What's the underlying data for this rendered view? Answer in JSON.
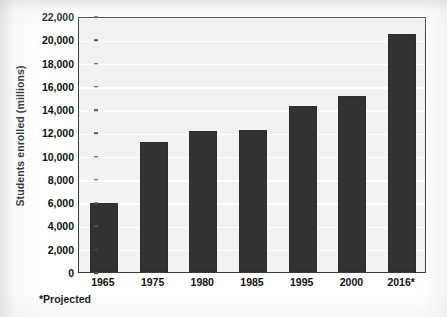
{
  "chart_data": {
    "type": "bar",
    "title": "",
    "xlabel": "",
    "ylabel": "Students enrolled (millions)",
    "categories": [
      "1965",
      "1975",
      "1980",
      "1985",
      "1995",
      "2000",
      "2016*"
    ],
    "values": [
      5921,
      11185,
      12097,
      12247,
      14261,
      15135,
      20442
    ],
    "value_labels": [
      "5,921",
      "11,185",
      "12,097",
      "12,247",
      "14,261",
      "15,135",
      "20,442"
    ],
    "ylim": [
      0,
      22000
    ],
    "ytick_step": 2000,
    "ytick_labels": [
      "0",
      "2,000",
      "4,000",
      "6,000",
      "8,000",
      "10,000",
      "12,000",
      "14,000",
      "16,000",
      "18,000",
      "20,000",
      "22,000"
    ],
    "ytick_values": [
      0,
      2000,
      4000,
      6000,
      8000,
      10000,
      12000,
      14000,
      16000,
      18000,
      20000,
      22000
    ],
    "grid": true,
    "grid_axis": "y",
    "legend": false,
    "legend_position": "none",
    "annotations": [
      "*Projected"
    ],
    "series": [
      {
        "name": "Students enrolled",
        "values": [
          5921,
          11185,
          12097,
          12247,
          14261,
          15135,
          20442
        ]
      }
    ]
  },
  "footnote": "*Projected",
  "colors": {
    "bar": "#333132",
    "plot_background": "#f2f2f2",
    "gridline": "#ffffff",
    "frame_border": "#3a3a3a",
    "text": "#101010",
    "page_background": "#ffffff"
  }
}
